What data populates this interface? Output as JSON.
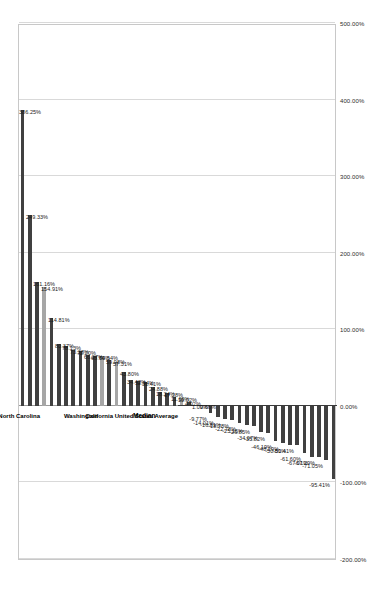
{
  "chart_data": {
    "type": "bar",
    "title": "",
    "subtitle": "",
    "xlabel": "",
    "ylabel": "",
    "orientation": "horizontal-rotated",
    "grid": true,
    "legend": "none",
    "axis": {
      "min": -200,
      "max": 500,
      "tick_step": 100,
      "tick_labels": [
        "500.00%",
        "400.00%",
        "300.00%",
        "200.00%",
        "100.00%",
        "0.00%",
        "-100.00%",
        "-200.00%"
      ],
      "tick_values": [
        500,
        400,
        300,
        200,
        100,
        0,
        -100,
        -200
      ]
    },
    "value_labels": [
      "386.25%",
      "249.33%",
      "161.16%",
      "154.91%",
      "114.81%",
      "80.37%",
      "78.13%",
      "73.38%",
      "72.20%",
      "66.27%",
      "65.70%",
      "64.54%",
      "59.98%",
      "57.31%",
      "43.80%",
      "34.42%",
      "32.94%",
      "31.41%",
      "24.88%",
      "18.24%",
      "17.28%",
      "11.69%",
      "10.02%",
      "4.92%",
      "1.09%",
      "0.66%",
      "-9.77%",
      "-14.01%",
      "-16.81%",
      "-18.78%",
      "-22.78%",
      "-25.15%",
      "-26.85%",
      "-34.07%",
      "-35.82%",
      "-46.19%",
      "-48.19%",
      "-50.80%",
      "-51.41%",
      "-61.60%",
      "-67.01%",
      "-67.29%",
      "-71.05%",
      "-95.41%"
    ],
    "values": [
      386.25,
      249.33,
      161.16,
      154.91,
      114.81,
      80.37,
      78.13,
      73.38,
      72.2,
      66.27,
      65.7,
      64.54,
      59.98,
      57.31,
      43.8,
      34.42,
      32.94,
      31.41,
      24.88,
      18.24,
      17.28,
      11.69,
      10.02,
      4.92,
      1.09,
      0.66,
      -9.77,
      -14.01,
      -16.81,
      -18.78,
      -22.78,
      -25.15,
      -26.85,
      -34.07,
      -35.82,
      -46.19,
      -48.19,
      -50.8,
      -51.41,
      -61.6,
      -67.01,
      -67.29,
      -71.05,
      -95.41
    ],
    "highlighted_indices": [
      3,
      11,
      13,
      22
    ],
    "annotations": [
      {
        "label": "North Carolina",
        "index": 3
      },
      {
        "label": "Washington",
        "index": 11
      },
      {
        "label": "California",
        "index": 13
      },
      {
        "label": "United States Average",
        "index": 22
      },
      {
        "label": "Median",
        "index": -1
      }
    ],
    "median_marker": {
      "label": "Median",
      "value": 0
    },
    "colors": {
      "bar": "#404040",
      "bar_highlight": "#a6a6a6",
      "grid": "#d9d9d9",
      "zero_line": "#9a9a9a",
      "median_line": "#3a3a3a",
      "text": "#1a1a1a"
    }
  }
}
